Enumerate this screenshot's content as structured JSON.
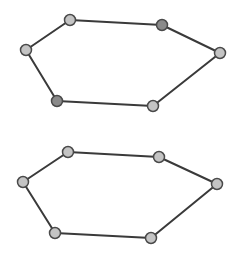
{
  "diagram": {
    "width": 237,
    "height": 259,
    "background": "#ffffff",
    "edge_color": "#3a3a3a",
    "edge_width": 2,
    "node_radius": 5.5,
    "node_stroke": "#4a4a4a",
    "colors": {
      "light": "#c4c4c4",
      "dark": "#8a8a8a"
    },
    "graphs": [
      {
        "name": "top-hexagon",
        "nodes": [
          {
            "id": "t1",
            "x": 70,
            "y": 20,
            "shade": "light"
          },
          {
            "id": "t2",
            "x": 162,
            "y": 25,
            "shade": "dark"
          },
          {
            "id": "t3",
            "x": 220,
            "y": 53,
            "shade": "light"
          },
          {
            "id": "t4",
            "x": 153,
            "y": 106,
            "shade": "light"
          },
          {
            "id": "t5",
            "x": 57,
            "y": 101,
            "shade": "dark"
          },
          {
            "id": "t6",
            "x": 26,
            "y": 50,
            "shade": "light"
          }
        ]
      },
      {
        "name": "bottom-hexagon",
        "nodes": [
          {
            "id": "b1",
            "x": 68,
            "y": 152,
            "shade": "light"
          },
          {
            "id": "b2",
            "x": 159,
            "y": 157,
            "shade": "light"
          },
          {
            "id": "b3",
            "x": 217,
            "y": 184,
            "shade": "light"
          },
          {
            "id": "b4",
            "x": 151,
            "y": 238,
            "shade": "light"
          },
          {
            "id": "b5",
            "x": 55,
            "y": 233,
            "shade": "light"
          },
          {
            "id": "b6",
            "x": 23,
            "y": 182,
            "shade": "light"
          }
        ]
      }
    ]
  }
}
